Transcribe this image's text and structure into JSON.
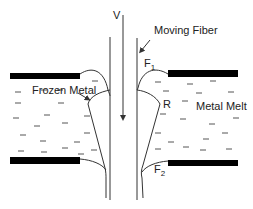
{
  "diagram": {
    "labels": {
      "velocity": "V",
      "moving_fiber": "Moving Fiber",
      "frozen_metal": "Frozen Metal",
      "metal_melt": "Metal Melt",
      "f1": "F",
      "f1_sub": "1",
      "r": "R",
      "f2": "F",
      "f2_sub": "2"
    },
    "colors": {
      "stroke": "#333333",
      "bar": "#000000",
      "dash": "#555555",
      "background": "#ffffff"
    }
  }
}
